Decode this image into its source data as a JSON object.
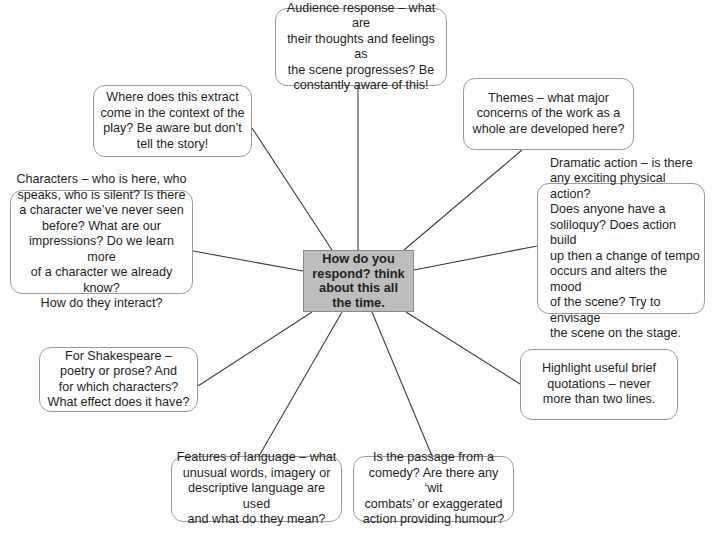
{
  "diagram": {
    "type": "mind-map",
    "center": {
      "text": "How do you\nrespond? think\nabout this all\nthe time.",
      "fill": "#bdbdbd"
    },
    "nodes": [
      {
        "id": "audience",
        "text": "Audience response – what are\ntheir thoughts and feelings as\nthe scene progresses? Be\nconstantly aware of this!"
      },
      {
        "id": "context",
        "text": "Where does this extract\ncome in the context of the\nplay? Be aware but don’t\ntell the story!"
      },
      {
        "id": "themes",
        "text": "Themes – what major\nconcerns of the work as a\nwhole are developed here?"
      },
      {
        "id": "characters",
        "text": "Characters – who is here, who\nspeaks, who is silent? Is there\na character we’ve never seen\nbefore? What are our\nimpressions? Do we learn more\nof a character we already know?\nHow do they interact?"
      },
      {
        "id": "dramatic",
        "text": "Dramatic action – is there\nany exciting physical action?\nDoes anyone have a\nsoliloquy? Does action build\nup then a change of tempo\noccurs and alters the mood\nof the scene? Try to envisage\nthe scene on the stage."
      },
      {
        "id": "shakespeare",
        "text": "For Shakespeare –\npoetry or prose? And\nfor which characters?\nWhat effect does it have?"
      },
      {
        "id": "quotations",
        "text": "Highlight useful brief\nquotations – never\nmore than two lines."
      },
      {
        "id": "language",
        "text": "Features of language – what\nunusual words, imagery or\ndescriptive language are used\nand what do they mean?"
      },
      {
        "id": "comedy",
        "text": "Is the passage from a\ncomedy? Are there any ‘wit\ncombats’ or exaggerated\naction providing humour?"
      }
    ],
    "colors": {
      "node_border": "#9a9a9a",
      "connector": "#3a3a3a",
      "text": "#231f20"
    }
  }
}
